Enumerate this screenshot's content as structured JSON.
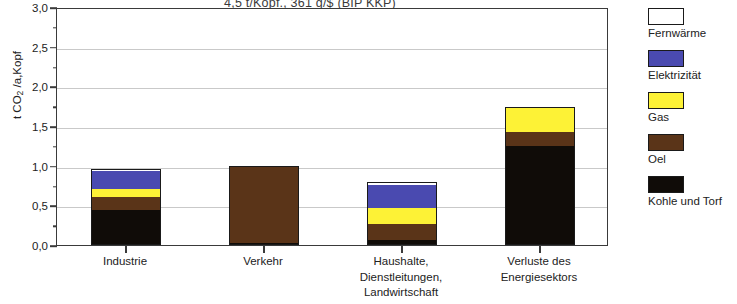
{
  "chart_data": {
    "type": "bar",
    "title": "4,5 t/Kopf.,   361 g/$  (BIP KKP)",
    "xlabel": "",
    "ylabel": "t CO2 /a,Kopf",
    "ylabel_pre": "t CO",
    "ylabel_sub": "2",
    "ylabel_post": " /a,Kopf",
    "ylim": [
      0.0,
      3.0
    ],
    "ytick_step": 0.5,
    "yminor_step": 0.25,
    "grid": true,
    "stacked": true,
    "legend_position": "right",
    "categories": [
      "Industrie",
      "Verkehr",
      "Haushalte, Dienstleitungen, Landwirtschaft",
      "Verluste des Energiesektors"
    ],
    "category_lines": [
      [
        "Industrie"
      ],
      [
        "Verkehr"
      ],
      [
        "Haushalte,",
        "Dienstleitungen,",
        "Landwirtschaft"
      ],
      [
        "Verluste des",
        "Energiesektors"
      ]
    ],
    "ytick_labels": [
      "0,0",
      "0,5",
      "1,0",
      "1,5",
      "2,0",
      "2,5",
      "3,0"
    ],
    "ytick_values": [
      0.0,
      0.5,
      1.0,
      1.5,
      2.0,
      2.5,
      3.0
    ],
    "series": [
      {
        "name": "Kohle und Torf",
        "color": "#100c08",
        "values": [
          0.44,
          0.02,
          0.06,
          1.25
        ]
      },
      {
        "name": "Oel",
        "color": "#5a3418",
        "values": [
          0.16,
          0.98,
          0.21,
          0.17
        ]
      },
      {
        "name": "Gas",
        "color": "#fdf236",
        "values": [
          0.1,
          0.0,
          0.2,
          0.32
        ]
      },
      {
        "name": "Elektrizität",
        "color": "#4a4ab0",
        "values": [
          0.23,
          0.0,
          0.29,
          0.0
        ]
      },
      {
        "name": "Fernwärme",
        "color": "#ffffff",
        "values": [
          0.03,
          0.0,
          0.03,
          0.0
        ]
      }
    ],
    "totals": [
      0.96,
      1.0,
      0.79,
      1.74
    ],
    "legend_order_top_to_bottom": [
      "Fernwärme",
      "Elektrizität",
      "Gas",
      "Oel",
      "Kohle und Torf"
    ]
  }
}
